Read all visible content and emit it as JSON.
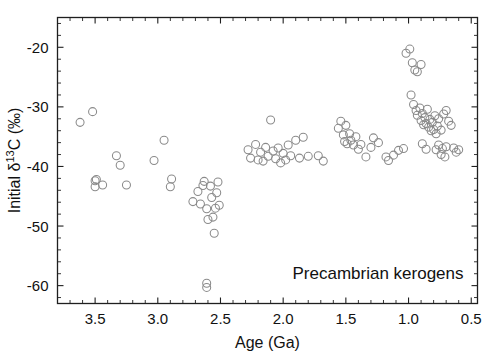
{
  "figure": {
    "background_color": "#ffffff",
    "frame_color": "#1f1f1f",
    "marker_color": "#8a8a8a",
    "annotation": "Precambrian kerogens"
  },
  "chart_data": {
    "type": "scatter",
    "title": "",
    "xlabel": "Age (Ga)",
    "ylabel": "Initial δ13C (‰)",
    "ylabel_parts": {
      "prefix": "Initial δ",
      "superscript": "13",
      "suffix": "C (‰)"
    },
    "xlim": [
      3.8,
      0.45
    ],
    "ylim": [
      -63,
      -15
    ],
    "x_inverted": true,
    "grid": false,
    "legend": null,
    "xticks": [
      3.5,
      3.0,
      2.5,
      2.0,
      1.5,
      1.0,
      0.5
    ],
    "xticklabels": [
      "3.5",
      "3.0",
      "2.5",
      "2.0",
      "1.5",
      "1.0",
      "0.5"
    ],
    "x_minor_step": 0.1,
    "yticks": [
      -20,
      -30,
      -40,
      -50,
      -60
    ],
    "yticklabels": [
      "-20",
      "-30",
      "-40",
      "-50",
      "-60"
    ],
    "y_minor_step": 2,
    "series": [
      {
        "name": "Precambrian kerogens",
        "marker": "open-circle",
        "marker_size": 8,
        "points": [
          [
            3.62,
            -32.6
          ],
          [
            3.52,
            -30.8
          ],
          [
            3.5,
            -43.4
          ],
          [
            3.5,
            -42.4
          ],
          [
            3.49,
            -42.2
          ],
          [
            3.44,
            -43.1
          ],
          [
            3.33,
            -38.2
          ],
          [
            3.3,
            -39.8
          ],
          [
            3.25,
            -43.1
          ],
          [
            3.03,
            -39.0
          ],
          [
            2.95,
            -35.6
          ],
          [
            2.9,
            -43.4
          ],
          [
            2.89,
            -42.1
          ],
          [
            2.72,
            -45.9
          ],
          [
            2.68,
            -44.2
          ],
          [
            2.66,
            -46.3
          ],
          [
            2.64,
            -43.2
          ],
          [
            2.63,
            -42.5
          ],
          [
            2.61,
            -47.1
          ],
          [
            2.6,
            -48.9
          ],
          [
            2.58,
            -43.3
          ],
          [
            2.57,
            -45.2
          ],
          [
            2.56,
            -48.5
          ],
          [
            2.55,
            -51.2
          ],
          [
            2.54,
            -47.0
          ],
          [
            2.53,
            -44.4
          ],
          [
            2.52,
            -42.6
          ],
          [
            2.51,
            -46.5
          ],
          [
            2.61,
            -59.6
          ],
          [
            2.61,
            -60.3
          ],
          [
            2.28,
            -37.2
          ],
          [
            2.26,
            -38.6
          ],
          [
            2.22,
            -36.3
          ],
          [
            2.2,
            -38.9
          ],
          [
            2.18,
            -37.6
          ],
          [
            2.16,
            -39.1
          ],
          [
            2.14,
            -36.8
          ],
          [
            2.12,
            -38.3
          ],
          [
            2.1,
            -32.2
          ],
          [
            2.08,
            -37.4
          ],
          [
            2.06,
            -38.7
          ],
          [
            2.04,
            -36.9
          ],
          [
            2.02,
            -39.4
          ],
          [
            2.0,
            -37.8
          ],
          [
            1.98,
            -38.9
          ],
          [
            1.96,
            -36.4
          ],
          [
            1.94,
            -38.2
          ],
          [
            1.9,
            -35.6
          ],
          [
            1.87,
            -38.6
          ],
          [
            1.84,
            -35.1
          ],
          [
            1.8,
            -38.3
          ],
          [
            1.72,
            -38.2
          ],
          [
            1.68,
            -39.1
          ],
          [
            1.56,
            -33.6
          ],
          [
            1.54,
            -32.4
          ],
          [
            1.52,
            -34.7
          ],
          [
            1.51,
            -35.8
          ],
          [
            1.5,
            -33.1
          ],
          [
            1.49,
            -36.2
          ],
          [
            1.47,
            -34.5
          ],
          [
            1.46,
            -35.6
          ],
          [
            1.44,
            -36.4
          ],
          [
            1.42,
            -35.0
          ],
          [
            1.4,
            -37.1
          ],
          [
            1.38,
            -36.3
          ],
          [
            1.34,
            -38.4
          ],
          [
            1.3,
            -36.8
          ],
          [
            1.18,
            -38.4
          ],
          [
            1.16,
            -39.0
          ],
          [
            1.12,
            -38.1
          ],
          [
            1.08,
            -37.3
          ],
          [
            1.04,
            -37.0
          ],
          [
            1.02,
            -21.0
          ],
          [
            0.99,
            -20.3
          ],
          [
            0.97,
            -22.6
          ],
          [
            0.95,
            -23.8
          ],
          [
            0.93,
            -24.1
          ],
          [
            0.9,
            -22.9
          ],
          [
            0.98,
            -28.0
          ],
          [
            0.96,
            -29.6
          ],
          [
            0.94,
            -30.6
          ],
          [
            0.93,
            -31.4
          ],
          [
            0.91,
            -30.2
          ],
          [
            0.9,
            -32.3
          ],
          [
            0.89,
            -31.1
          ],
          [
            0.88,
            -33.0
          ],
          [
            0.87,
            -31.8
          ],
          [
            0.86,
            -32.8
          ],
          [
            0.85,
            -30.4
          ],
          [
            0.84,
            -33.4
          ],
          [
            0.83,
            -32.1
          ],
          [
            0.82,
            -34.0
          ],
          [
            0.81,
            -32.6
          ],
          [
            0.8,
            -33.8
          ],
          [
            0.79,
            -31.5
          ],
          [
            0.78,
            -34.5
          ],
          [
            0.77,
            -33.2
          ],
          [
            0.76,
            -32.0
          ],
          [
            0.74,
            -33.9
          ],
          [
            0.72,
            -31.2
          ],
          [
            0.7,
            -30.6
          ],
          [
            0.68,
            -32.4
          ],
          [
            0.66,
            -33.1
          ],
          [
            0.78,
            -37.2
          ],
          [
            0.76,
            -36.4
          ],
          [
            0.74,
            -38.0
          ],
          [
            0.73,
            -37.0
          ],
          [
            0.71,
            -38.4
          ],
          [
            0.7,
            -36.7
          ],
          [
            0.64,
            -36.9
          ],
          [
            0.62,
            -37.6
          ],
          [
            0.6,
            -37.2
          ],
          [
            0.89,
            -36.2
          ],
          [
            0.86,
            -37.1
          ],
          [
            1.28,
            -35.2
          ],
          [
            1.24,
            -36.0
          ]
        ]
      }
    ]
  }
}
